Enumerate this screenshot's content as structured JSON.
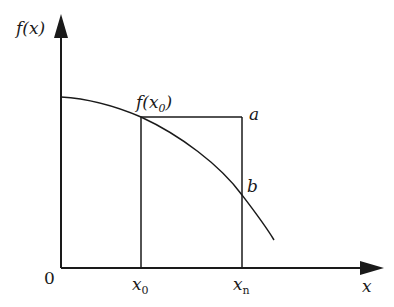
{
  "diagram": {
    "type": "function-plot-schematic",
    "axes": {
      "y_label": "f(x)",
      "x_label": "x",
      "origin_label": "0"
    },
    "points": {
      "f_x0_label": "f(x",
      "f_x0_sub": "0",
      "f_x0_close": ")",
      "a_label": "a",
      "b_label": "b"
    },
    "ticks": [
      {
        "base": "x",
        "sub": "0"
      },
      {
        "base": "x",
        "sub": "n"
      }
    ],
    "colors": {
      "line": "#1a1a1a",
      "background": "#ffffff"
    }
  }
}
